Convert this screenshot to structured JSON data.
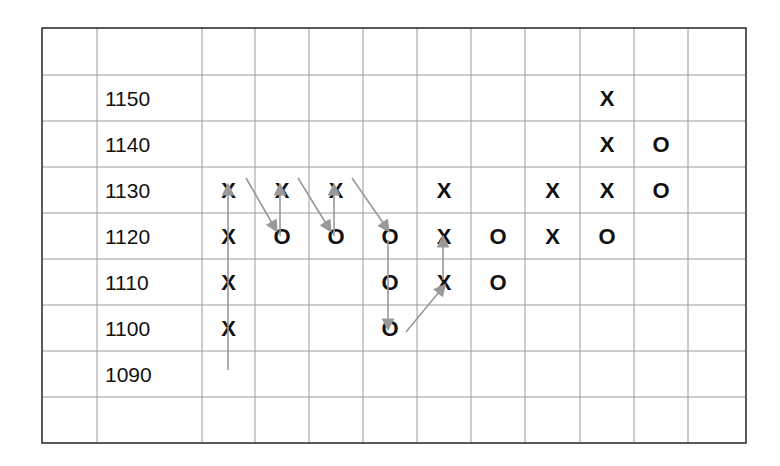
{
  "chart_data": {
    "type": "table",
    "subtype": "point-and-figure",
    "title": "",
    "box_size": 10,
    "price_levels": [
      1150,
      1140,
      1130,
      1120,
      1110,
      1100,
      1090
    ],
    "columns": [
      {
        "index": 1,
        "symbol": "X",
        "from": 1100,
        "to": 1130
      },
      {
        "index": 2,
        "symbol": "O",
        "from": 1120,
        "to": 1120
      },
      {
        "index": 3,
        "symbol": "X",
        "from": 1130,
        "to": 1130
      },
      {
        "index": 4,
        "symbol": "O",
        "from": 1120,
        "to": 1120
      },
      {
        "index": 5,
        "symbol": "X",
        "from": 1130,
        "to": 1130
      },
      {
        "index": 6,
        "symbol": "O",
        "from": 1120,
        "to": 1100
      },
      {
        "index": 7,
        "symbol": "X",
        "from": 1110,
        "to": 1130
      },
      {
        "index": 8,
        "symbol": "O",
        "from": 1120,
        "to": 1110
      },
      {
        "index": 9,
        "symbol": "X",
        "from": 1120,
        "to": 1130
      },
      {
        "index": 10,
        "symbol": "mixed",
        "entries": [
          {
            "price": 1150,
            "symbol": "X"
          },
          {
            "price": 1140,
            "symbol": "X"
          },
          {
            "price": 1130,
            "symbol": "X"
          },
          {
            "price": 1120,
            "symbol": "O"
          }
        ]
      },
      {
        "index": 11,
        "symbol": "O",
        "from": 1140,
        "to": 1130
      }
    ],
    "annotations": "Gray arrows trace the price path: up column 1 from 1090 to 1130, diagonal down to 1120 O, up to 1130 X, repeated; then down 1120→1100 in column 6, diagonal up to 1110 X in column 7, up to 1120.",
    "grid": true,
    "legend": null
  },
  "grid": {
    "x_lines": [
      42,
      97,
      202,
      255,
      309,
      363,
      417,
      471,
      525,
      580,
      634,
      688,
      746
    ],
    "y_lines": [
      28,
      75,
      121,
      167,
      213,
      259,
      305,
      351,
      397,
      443
    ]
  },
  "labels": {
    "rows": [
      {
        "row": 1,
        "text": "1150"
      },
      {
        "row": 2,
        "text": "1140"
      },
      {
        "row": 3,
        "text": "1130"
      },
      {
        "row": 4,
        "text": "1120"
      },
      {
        "row": 5,
        "text": "1110"
      },
      {
        "row": 6,
        "text": "1100"
      },
      {
        "row": 7,
        "text": "1090"
      }
    ]
  },
  "marks": [
    {
      "col": 2,
      "row": 3,
      "text": "X"
    },
    {
      "col": 2,
      "row": 4,
      "text": "X"
    },
    {
      "col": 2,
      "row": 5,
      "text": "X"
    },
    {
      "col": 2,
      "row": 6,
      "text": "X"
    },
    {
      "col": 3,
      "row": 3,
      "text": "X"
    },
    {
      "col": 3,
      "row": 4,
      "text": "O"
    },
    {
      "col": 4,
      "row": 3,
      "text": "X"
    },
    {
      "col": 4,
      "row": 4,
      "text": "O"
    },
    {
      "col": 5,
      "row": 4,
      "text": "O"
    },
    {
      "col": 5,
      "row": 5,
      "text": "O"
    },
    {
      "col": 5,
      "row": 6,
      "text": "O"
    },
    {
      "col": 6,
      "row": 3,
      "text": "X"
    },
    {
      "col": 6,
      "row": 4,
      "text": "X"
    },
    {
      "col": 6,
      "row": 5,
      "text": "X"
    },
    {
      "col": 7,
      "row": 4,
      "text": "O"
    },
    {
      "col": 7,
      "row": 5,
      "text": "O"
    },
    {
      "col": 8,
      "row": 3,
      "text": "X"
    },
    {
      "col": 8,
      "row": 4,
      "text": "X"
    },
    {
      "col": 9,
      "row": 1,
      "text": "X"
    },
    {
      "col": 9,
      "row": 2,
      "text": "X"
    },
    {
      "col": 9,
      "row": 3,
      "text": "X"
    },
    {
      "col": 9,
      "row": 4,
      "text": "O"
    },
    {
      "col": 10,
      "row": 2,
      "text": "O"
    },
    {
      "col": 10,
      "row": 3,
      "text": "O"
    }
  ],
  "arrows": [
    {
      "x1": 228,
      "y1": 370,
      "x2": 228,
      "y2": 186
    },
    {
      "x1": 246,
      "y1": 178,
      "x2": 276,
      "y2": 230
    },
    {
      "x1": 280,
      "y1": 236,
      "x2": 280,
      "y2": 186
    },
    {
      "x1": 298,
      "y1": 178,
      "x2": 330,
      "y2": 230
    },
    {
      "x1": 334,
      "y1": 236,
      "x2": 334,
      "y2": 186
    },
    {
      "x1": 352,
      "y1": 178,
      "x2": 388,
      "y2": 230
    },
    {
      "x1": 388,
      "y1": 240,
      "x2": 388,
      "y2": 328
    },
    {
      "x1": 406,
      "y1": 332,
      "x2": 444,
      "y2": 286
    },
    {
      "x1": 443,
      "y1": 280,
      "x2": 443,
      "y2": 238
    }
  ],
  "colors": {
    "grid_line": "#9a9a9a",
    "border": "#333333",
    "text": "#111111",
    "arrow": "#999999"
  }
}
